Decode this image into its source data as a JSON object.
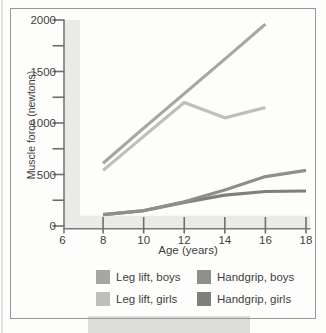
{
  "figure": {
    "background": "#fdfdfb",
    "border_color": "#98989a",
    "shadow_color": "#dcdcda",
    "axis_band_color": "#eaeae8",
    "axis_edge_color": "#7b7b79",
    "tick_color": "#6e6e6c",
    "text_color": "#3f3f3d"
  },
  "chart_data": {
    "type": "line",
    "title": "",
    "xlabel": "Age (years)",
    "ylabel": "Muscle force (newtons)",
    "x_ticks": [
      6,
      8,
      10,
      12,
      14,
      16,
      18
    ],
    "y_tick_labels": [
      0,
      500,
      1000,
      1500,
      2000
    ],
    "y_minor_tick_step": 250,
    "xlim": [
      6,
      18.2
    ],
    "ylim": [
      0,
      2000
    ],
    "grid": false,
    "legend_position": "bottom",
    "series": [
      {
        "name": "Leg lift, boys",
        "color": "#a6a6a4",
        "x": [
          8,
          10,
          12,
          14,
          16
        ],
        "values": [
          610,
          950,
          1285,
          1620,
          1960
        ]
      },
      {
        "name": "Leg lift, girls",
        "color": "#bebebc",
        "x": [
          8,
          10,
          12,
          14,
          16
        ],
        "values": [
          540,
          870,
          1200,
          1050,
          1150
        ]
      },
      {
        "name": "Handgrip, boys",
        "color": "#8e8e8c",
        "x": [
          8,
          10,
          12,
          14,
          16,
          18
        ],
        "values": [
          110,
          150,
          235,
          350,
          480,
          540
        ]
      },
      {
        "name": "Handgrip, girls",
        "color": "#7f7f7d",
        "x": [
          8,
          10,
          12,
          14,
          16,
          18
        ],
        "values": [
          110,
          148,
          230,
          300,
          335,
          340
        ]
      }
    ]
  }
}
